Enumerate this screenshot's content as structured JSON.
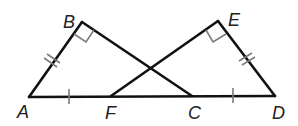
{
  "diagram": {
    "type": "geometry",
    "points": {
      "A": {
        "label": "A",
        "x": 29,
        "y": 97
      },
      "B": {
        "label": "B",
        "x": 82,
        "y": 22
      },
      "C": {
        "label": "C",
        "x": 192,
        "y": 96
      },
      "D": {
        "label": "D",
        "x": 275,
        "y": 96
      },
      "E": {
        "label": "E",
        "x": 218,
        "y": 21
      },
      "F": {
        "label": "F",
        "x": 111,
        "y": 96
      }
    },
    "segments": [
      "AB",
      "BC",
      "AD",
      "FE",
      "ED"
    ],
    "right_angles": [
      "B",
      "E"
    ],
    "congruence_marks": {
      "double_tick": [
        "AB",
        "ED"
      ],
      "single_tick": [
        "AF",
        "CD"
      ]
    },
    "colors": {
      "line": "#111111",
      "marks": "#7a7a7a",
      "label": "#222222"
    }
  }
}
